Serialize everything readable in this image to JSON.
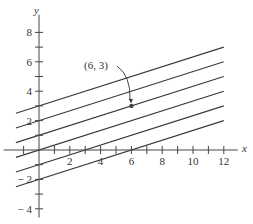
{
  "chart_data": {
    "type": "line",
    "title": "",
    "xlabel": "x",
    "ylabel": "y",
    "xlim": [
      -2,
      13
    ],
    "ylim": [
      -4.5,
      9
    ],
    "x_ticks": [
      -1,
      1,
      2,
      3,
      4,
      5,
      6,
      7,
      8,
      9,
      10,
      11,
      12
    ],
    "x_tick_labels": [
      "2",
      "4",
      "6",
      "8",
      "10",
      "12"
    ],
    "x_tick_label_values": [
      2,
      4,
      6,
      8,
      10,
      12
    ],
    "y_ticks": [
      -4,
      -3,
      -2,
      -1,
      1,
      2,
      3,
      4,
      5,
      6,
      7,
      8
    ],
    "y_tick_labels": [
      "8",
      "6",
      "4",
      "2",
      "-2",
      "-4"
    ],
    "y_tick_label_values": [
      8,
      6,
      4,
      2,
      -2,
      -4
    ],
    "grid": false,
    "series": [
      {
        "name": "y = x/3 + 3",
        "x": [
          -1.5,
          12
        ],
        "y": [
          2.5,
          7
        ]
      },
      {
        "name": "y = x/3 + 2",
        "x": [
          -1.5,
          12
        ],
        "y": [
          1.5,
          6
        ]
      },
      {
        "name": "y = x/3 + 1",
        "x": [
          -1.5,
          12
        ],
        "y": [
          0.5,
          5
        ]
      },
      {
        "name": "y = x/3",
        "x": [
          -1.5,
          12
        ],
        "y": [
          -0.5,
          4
        ]
      },
      {
        "name": "y = x/3 - 1",
        "x": [
          -1.5,
          12
        ],
        "y": [
          -1.5,
          3
        ]
      },
      {
        "name": "y = x/3 - 2",
        "x": [
          -1.5,
          12
        ],
        "y": [
          -2.5,
          2
        ]
      }
    ],
    "annotations": [
      {
        "text": "(6, 3)",
        "point": [
          6,
          3
        ],
        "label_pos": [
          3.2,
          5.5
        ],
        "arrow": true
      }
    ]
  },
  "labels": {
    "x_axis": "x",
    "y_axis": "y",
    "point_annotation": "(6, 3)"
  },
  "colors": {
    "line": "#3a3a3a",
    "axis": "#444444",
    "text": "#333333"
  }
}
